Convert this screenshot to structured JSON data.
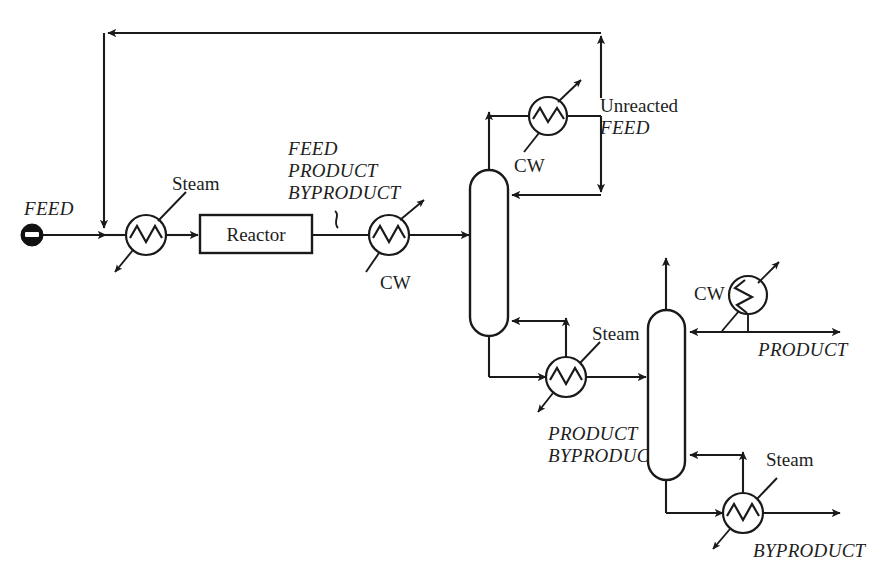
{
  "diagram": {
    "line_color": "#1a1a1a",
    "background": "#ffffff"
  },
  "equipment": {
    "reactor_label": "Reactor",
    "column1_name": "first-distillation-column",
    "column2_name": "second-distillation-column"
  },
  "labels": {
    "feed_inlet": "FEED",
    "feed_preheater_utility": "Steam",
    "reactor_effluent": {
      "line1": "FEED",
      "line2": "PRODUCT",
      "line3": "BYPRODUCT"
    },
    "reactor_cooler_utility": "CW",
    "col1_condenser_utility": "CW",
    "unreacted_recycle": {
      "line1": "Unreacted",
      "line2": "FEED"
    },
    "col1_reboiler_utility": "Steam",
    "col1_bottoms": {
      "line1": "PRODUCT",
      "line2": "BYPRODUCT"
    },
    "col2_condenser_utility": "CW",
    "product_outlet": "PRODUCT",
    "col2_reboiler_utility": "Steam",
    "byproduct_outlet": "BYPRODUCT"
  },
  "icons": {
    "feed_source": "feed-source-marker",
    "heat_exchanger": "heat-exchanger-icon",
    "column": "distillation-column-icon",
    "reactor": "reactor-vessel-icon",
    "arrow": "flow-arrow-icon",
    "squiggle": "stream-break-icon"
  }
}
